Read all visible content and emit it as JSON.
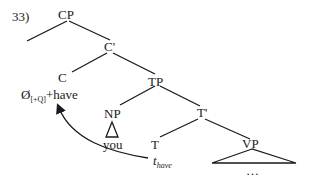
{
  "example_number": "33)",
  "tree": {
    "nodes": {
      "cp": "CP",
      "c_bar": "C'",
      "c": "C",
      "c_content": {
        "null": "Ø",
        "feature": "[+Q]",
        "plus_word": "+have"
      },
      "tp": "TP",
      "np": "NP",
      "np_content": "you",
      "t_bar": "T'",
      "t": "T",
      "trace": {
        "t": "t",
        "subscript": "have"
      },
      "vp": "VP",
      "vp_content": "…"
    },
    "movement": {
      "from": "T (trace t_have)",
      "to": "C (Ø[+Q]+have)"
    }
  }
}
